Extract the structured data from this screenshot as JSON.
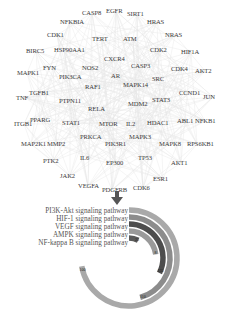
{
  "network": {
    "genes": [
      {
        "name": "CASP8",
        "x": 82,
        "y": 10
      },
      {
        "name": "EGFR",
        "x": 106,
        "y": 8
      },
      {
        "name": "SIRT1",
        "x": 127,
        "y": 11
      },
      {
        "name": "NFKBIA",
        "x": 60,
        "y": 19
      },
      {
        "name": "HRAS",
        "x": 147,
        "y": 19
      },
      {
        "name": "CDK1",
        "x": 47,
        "y": 32
      },
      {
        "name": "TERT",
        "x": 92,
        "y": 36
      },
      {
        "name": "ATM",
        "x": 123,
        "y": 36
      },
      {
        "name": "NRAS",
        "x": 165,
        "y": 32
      },
      {
        "name": "BIRC5",
        "x": 26,
        "y": 48
      },
      {
        "name": "HSP90AA1",
        "x": 54,
        "y": 47
      },
      {
        "name": "CDK2",
        "x": 150,
        "y": 47
      },
      {
        "name": "HIF1A",
        "x": 181,
        "y": 49
      },
      {
        "name": "CXCR4",
        "x": 104,
        "y": 56
      },
      {
        "name": "FYN",
        "x": 43,
        "y": 65
      },
      {
        "name": "NOS2",
        "x": 82,
        "y": 65
      },
      {
        "name": "CASP3",
        "x": 131,
        "y": 63
      },
      {
        "name": "CDK4",
        "x": 171,
        "y": 66
      },
      {
        "name": "AKT2",
        "x": 195,
        "y": 68
      },
      {
        "name": "MAPK1",
        "x": 17,
        "y": 70
      },
      {
        "name": "PIK3CA",
        "x": 59,
        "y": 74
      },
      {
        "name": "AR",
        "x": 111,
        "y": 73
      },
      {
        "name": "SRC",
        "x": 152,
        "y": 76
      },
      {
        "name": "RAF1",
        "x": 85,
        "y": 84
      },
      {
        "name": "MAPK14",
        "x": 123,
        "y": 82
      },
      {
        "name": "CCND1",
        "x": 179,
        "y": 90
      },
      {
        "name": "JUN",
        "x": 203,
        "y": 94
      },
      {
        "name": "TNF",
        "x": 16,
        "y": 95
      },
      {
        "name": "TGFB1",
        "x": 29,
        "y": 90
      },
      {
        "name": "PTPN11",
        "x": 59,
        "y": 98
      },
      {
        "name": "STAT3",
        "x": 152,
        "y": 97
      },
      {
        "name": "MDM2",
        "x": 128,
        "y": 101
      },
      {
        "name": "RELA",
        "x": 88,
        "y": 106
      },
      {
        "name": "ITGB1",
        "x": 14,
        "y": 121
      },
      {
        "name": "PPARG",
        "x": 30,
        "y": 117
      },
      {
        "name": "STAT1",
        "x": 62,
        "y": 120
      },
      {
        "name": "MTOR",
        "x": 99,
        "y": 121
      },
      {
        "name": "IL2",
        "x": 126,
        "y": 121
      },
      {
        "name": "HDAC1",
        "x": 147,
        "y": 120
      },
      {
        "name": "ABL1",
        "x": 177,
        "y": 118
      },
      {
        "name": "NFKB1",
        "x": 195,
        "y": 118
      },
      {
        "name": "PRKCA",
        "x": 80,
        "y": 134
      },
      {
        "name": "MAPK3",
        "x": 129,
        "y": 134
      },
      {
        "name": "MAP2K1",
        "x": 21,
        "y": 141
      },
      {
        "name": "MMP2",
        "x": 47,
        "y": 141
      },
      {
        "name": "PIK3R1",
        "x": 105,
        "y": 141
      },
      {
        "name": "MAPK8",
        "x": 159,
        "y": 141
      },
      {
        "name": "RPS6KB1",
        "x": 187,
        "y": 141
      },
      {
        "name": "PTK2",
        "x": 43,
        "y": 158
      },
      {
        "name": "IL6",
        "x": 80,
        "y": 155
      },
      {
        "name": "EP300",
        "x": 106,
        "y": 160
      },
      {
        "name": "TP53",
        "x": 138,
        "y": 155
      },
      {
        "name": "AKT1",
        "x": 171,
        "y": 160
      },
      {
        "name": "JAK2",
        "x": 60,
        "y": 173
      },
      {
        "name": "ESR1",
        "x": 153,
        "y": 176
      },
      {
        "name": "VEGFA",
        "x": 78,
        "y": 183
      },
      {
        "name": "PDGFRB",
        "x": 102,
        "y": 187
      },
      {
        "name": "CDK6",
        "x": 133,
        "y": 185
      }
    ]
  },
  "arrow": {
    "icon": "down-arrow-icon",
    "color": "#555555"
  },
  "chart_data": {
    "type": "radial-bar",
    "title": "",
    "categories": [
      "PI3K-Akt signaling pathway",
      "HIF-1 signaling pathway",
      "VEGF signaling pathway",
      "AMPK signaling pathway",
      "NF-kappa B signaling pathway"
    ],
    "series": [
      {
        "name": "PI3K-Akt signaling pathway",
        "value": 190,
        "color": "#a9a9a9"
      },
      {
        "name": "HIF-1 signaling pathway",
        "value": 120,
        "color": "#8c8c8c"
      },
      {
        "name": "VEGF signaling pathway",
        "value": 85,
        "color": "#4d4d4d"
      },
      {
        "name": "AMPK signaling pathway",
        "value": 60,
        "color": "#9a9a9a"
      },
      {
        "name": "NF-kappa B signaling pathway",
        "value": 20,
        "color": "#5a5a5a"
      }
    ],
    "value_labels": [
      "100",
      "110",
      "135",
      "8",
      "25"
    ],
    "legend_position": "left",
    "start_angle_deg": 0,
    "max_sweep_deg": 260
  },
  "legend": {
    "items": [
      "PI3K-Akt signaling pathway",
      "HIF-1 signaling pathway",
      "VEGF signaling pathway",
      "AMPK signaling pathway",
      "NF-kappa B signaling pathway"
    ]
  }
}
